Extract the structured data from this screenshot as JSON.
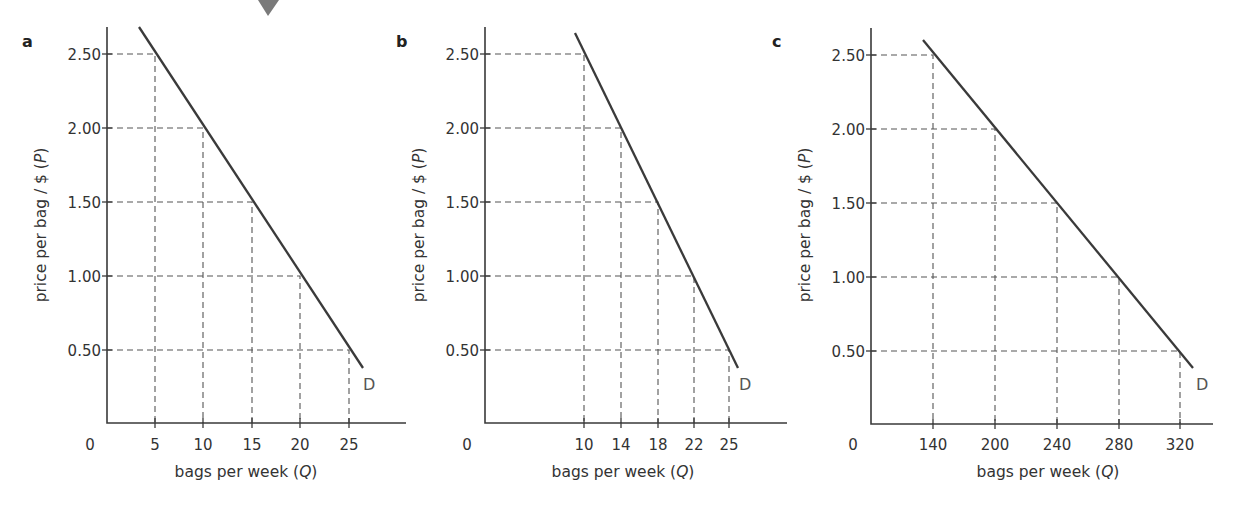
{
  "chart_data": [
    {
      "type": "line",
      "panel": "a",
      "title": "",
      "xlabel": "bags per week (Q)",
      "ylabel": "price per bag / $ (P)",
      "origin_label": "0",
      "curve_label": "D",
      "x_ticks": [
        "5",
        "10",
        "15",
        "20",
        "25"
      ],
      "y_ticks": [
        "0.50",
        "1.00",
        "1.50",
        "2.00",
        "2.50"
      ],
      "series": [
        {
          "name": "D",
          "x": [
            5,
            10,
            15,
            20,
            25
          ],
          "y": [
            2.5,
            2.0,
            1.5,
            1.0,
            0.5
          ]
        }
      ],
      "guides": "dashed lines from each point to both axes",
      "ylim": [
        0,
        2.7
      ],
      "grid": false,
      "legend": "none"
    },
    {
      "type": "line",
      "panel": "b",
      "title": "",
      "xlabel": "bags per week (Q)",
      "ylabel": "price per bag / $ (P)",
      "origin_label": "0",
      "curve_label": "D",
      "x_ticks": [
        "10",
        "14",
        "18",
        "22",
        "25"
      ],
      "y_ticks": [
        "0.50",
        "1.00",
        "1.50",
        "2.00",
        "2.50"
      ],
      "series": [
        {
          "name": "D",
          "x": [
            10,
            14,
            18,
            22,
            25
          ],
          "y": [
            2.5,
            2.0,
            1.5,
            1.0,
            0.5
          ]
        }
      ],
      "guides": "dashed lines from each point to both axes",
      "ylim": [
        0,
        2.7
      ],
      "grid": false,
      "legend": "none"
    },
    {
      "type": "line",
      "panel": "c",
      "title": "",
      "xlabel": "bags per week (Q)",
      "ylabel": "price per bag / $ (P)",
      "origin_label": "0",
      "curve_label": "D",
      "x_ticks": [
        "140",
        "200",
        "240",
        "280",
        "320"
      ],
      "y_ticks": [
        "0.50",
        "1.00",
        "1.50",
        "2.00",
        "2.50"
      ],
      "series": [
        {
          "name": "D",
          "x": [
            140,
            200,
            240,
            280,
            320
          ],
          "y": [
            2.5,
            2.0,
            1.5,
            1.0,
            0.5
          ]
        }
      ],
      "guides": "dashed lines from each point to both axes",
      "ylim": [
        0,
        2.7
      ],
      "grid": false,
      "legend": "none"
    }
  ],
  "layout": {
    "panels": [
      {
        "letter": "a",
        "letter_pos": [
          22,
          47
        ],
        "y_axis_x": 107,
        "x_axis_y": 423,
        "y_axis_top": 27,
        "x_axis_right": 406,
        "tick_x_px": [
          155,
          203,
          252,
          300,
          349
        ],
        "tick_y_px": [
          350,
          276,
          202,
          128,
          54
        ],
        "line": [
          [
            139,
            27
          ],
          [
            363,
            368
          ]
        ],
        "d_label_pos": [
          363,
          390
        ],
        "origin_pos": [
          90,
          450
        ],
        "ylabel_pos": [
          46,
          225
        ],
        "xlabel_pos": [
          246,
          477
        ]
      },
      {
        "letter": "b",
        "letter_pos": [
          396,
          47
        ],
        "y_axis_x": 485,
        "x_axis_y": 423,
        "y_axis_top": 27,
        "x_axis_right": 787,
        "tick_x_px": [
          584,
          621,
          658,
          694,
          729
        ],
        "tick_y_px": [
          350,
          276,
          202,
          128,
          54
        ],
        "line": [
          [
            575,
            33
          ],
          [
            738,
            368
          ]
        ],
        "d_label_pos": [
          739,
          390
        ],
        "origin_pos": [
          467,
          450
        ],
        "ylabel_pos": [
          424,
          225
        ],
        "xlabel_pos": [
          623,
          477
        ]
      },
      {
        "letter": "c",
        "letter_pos": [
          772,
          47
        ],
        "y_axis_x": 871,
        "x_axis_y": 424,
        "y_axis_top": 28,
        "x_axis_right": 1213,
        "tick_x_px": [
          933,
          995,
          1057,
          1119,
          1180
        ],
        "tick_y_px": [
          351,
          277,
          203,
          129,
          55
        ],
        "line": [
          [
            923,
            40
          ],
          [
            1193,
            368
          ]
        ],
        "d_label_pos": [
          1196,
          390
        ],
        "origin_pos": [
          853,
          450
        ],
        "ylabel_pos": [
          810,
          225
        ],
        "xlabel_pos": [
          1048,
          477
        ]
      }
    ],
    "arrow": {
      "points": "258,0 279,0 268,16"
    },
    "colors": {
      "axis": "#3a3a3a",
      "demand_line": "#3a3a3a",
      "guides": "#555555",
      "text": "#333333",
      "arrow": "#7a7a7a"
    }
  }
}
